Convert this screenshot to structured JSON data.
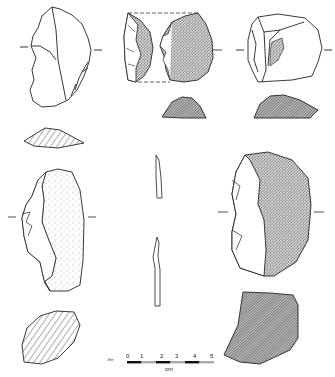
{
  "figure": {
    "type": "lithic artifact technical drawing",
    "background": "#ffffff",
    "ink_color": "#222222",
    "artifacts": [
      {
        "id": "A",
        "position": "top-left",
        "views": [
          "dorsal face with flake scars"
        ],
        "shading": "none"
      },
      {
        "id": "A-section",
        "position": "left, below A",
        "shading": "diagonal hatching"
      },
      {
        "id": "B",
        "position": "top-center",
        "views": [
          "profile",
          "dorsal with cortex stipple"
        ],
        "shading": "dense stipple"
      },
      {
        "id": "B-section",
        "position": "center, below B",
        "shading": "cross-hatch"
      },
      {
        "id": "C",
        "position": "top-right",
        "views": [
          "dorsal face with small cortex patch"
        ],
        "shading": "partial stipple"
      },
      {
        "id": "C-section",
        "position": "right, below C",
        "shading": "cross-hatch"
      },
      {
        "id": "D",
        "position": "middle-left",
        "views": [
          "dorsal with cortex"
        ],
        "shading": "light stipple"
      },
      {
        "id": "D-section",
        "position": "bottom-left",
        "shading": "diagonal hatching"
      },
      {
        "id": "E",
        "position": "center",
        "views": [
          "two narrow edge profiles"
        ],
        "shading": "none"
      },
      {
        "id": "F",
        "position": "middle-right",
        "views": [
          "dorsal with cortex"
        ],
        "shading": "dense stipple"
      },
      {
        "id": "F-section",
        "position": "bottom-right",
        "shading": "cross-hatch"
      }
    ]
  },
  "scale_bar": {
    "signature": "Jnr",
    "ticks": [
      "0",
      "1",
      "2",
      "3",
      "4",
      "5"
    ],
    "unit": "cm"
  }
}
